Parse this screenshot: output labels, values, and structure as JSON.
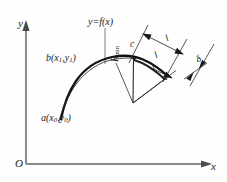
{
  "figure": {
    "kind": "geometry-diagram",
    "background_color": "#fefefe",
    "axis_color": "#8c8c8c",
    "curve_color": "#111111",
    "construction_color": "#3a3a3a",
    "axes": {
      "y_label": "y",
      "x_label": "x",
      "origin_label": "O"
    },
    "labels": {
      "function": "y=f(x)",
      "point_b": "b(x₁,y₁)",
      "point_a": "a(x₀,y₀)",
      "point_c": "c",
      "point_d": "d",
      "chord_upper": "l",
      "chord_lower": "l",
      "radius": "Rₘᵢₙ",
      "deflection": "δ"
    },
    "label_parts": {
      "point_b_base": "b(x",
      "point_b_sub1": "1",
      "point_b_mid": ",y",
      "point_b_sub2": "1",
      "point_b_end": ")",
      "point_a_base": "a(x",
      "point_a_sub1": "0",
      "point_a_mid": ",y",
      "point_a_sub2": "0",
      "point_a_end": ")",
      "radius_base": "R",
      "radius_sub": "min"
    }
  }
}
